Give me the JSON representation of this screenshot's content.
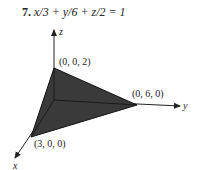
{
  "problem": {
    "number": "7.",
    "equation": "x/3 + y/6 + z/2 = 1"
  },
  "figure": {
    "axes": {
      "x": "x",
      "y": "y",
      "z": "z"
    },
    "vertices": [
      {
        "label": "(0, 0, 2)"
      },
      {
        "label": "(0, 6, 0)"
      },
      {
        "label": "(3, 0, 0)"
      }
    ],
    "fill_color": "#3a3a3a"
  }
}
